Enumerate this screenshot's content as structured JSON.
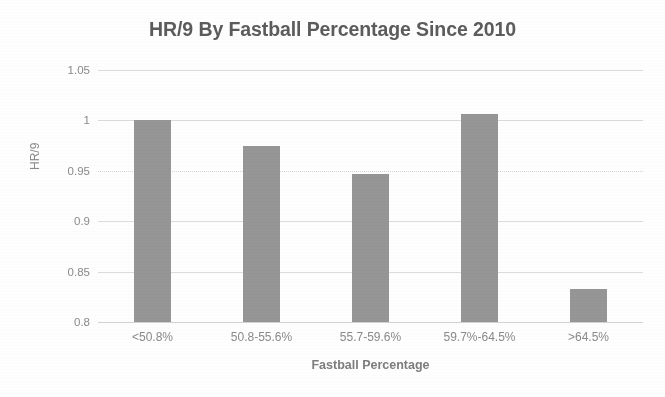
{
  "chart_data": {
    "type": "bar",
    "title": "HR/9 By Fastball Percentage Since 2010",
    "xlabel": "Fastball Percentage",
    "ylabel": "HR/9",
    "categories": [
      "<50.8%",
      "50.8-55.6%",
      "55.7-59.6%",
      "59.7%-64.5%",
      ">64.5%"
    ],
    "values": [
      1.0,
      0.975,
      0.947,
      1.006,
      0.833
    ],
    "ylim": [
      0.8,
      1.05
    ],
    "ytick_labels": [
      "1.05",
      "1",
      "0.95",
      "0.9",
      "0.85",
      "0.8"
    ],
    "ytick_values": [
      1.05,
      1,
      0.95,
      0.9,
      0.85,
      0.8
    ],
    "grid": true,
    "legend": "none",
    "series": [
      {
        "name": "HR/9",
        "values": [
          1.0,
          0.975,
          0.947,
          1.006,
          0.833
        ]
      }
    ],
    "colors": {
      "bar": "#969696",
      "title_text": "#5c5c5c",
      "axis_text": "#8a8a8a",
      "gridline": "#dcdcdc",
      "background": "#fefefe"
    }
  }
}
